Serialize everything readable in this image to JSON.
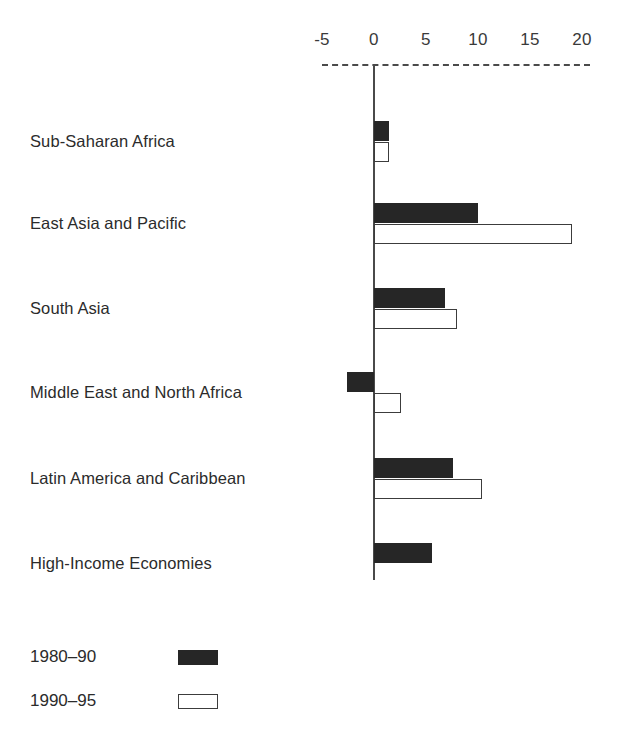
{
  "chart_data": {
    "type": "bar",
    "orientation": "horizontal",
    "title": "",
    "subtitle": "",
    "xlabel": "",
    "ylabel": "",
    "xlim": [
      -5,
      20
    ],
    "grid": false,
    "legend_position": "bottom-left",
    "xticks": [
      "-5",
      "0",
      "5",
      "10",
      "15",
      "20"
    ],
    "xtick_values": [
      -5,
      0,
      5,
      10,
      15,
      20
    ],
    "categories": [
      "Sub-Saharan Africa",
      "East Asia and Pacific",
      "South Asia",
      "Middle East and North Africa",
      "Latin America and Caribbean",
      "High-Income Economies"
    ],
    "series": [
      {
        "name": "1980-90",
        "style": "filled",
        "color": "#262626",
        "values": [
          1.4,
          10.0,
          6.8,
          -2.6,
          7.6,
          5.6
        ]
      },
      {
        "name": "1990-95",
        "style": "open",
        "color": "#ffffff",
        "values": [
          1.4,
          19.0,
          8.0,
          2.6,
          10.4,
          null
        ]
      }
    ],
    "annotations": []
  },
  "legend": {
    "items": [
      {
        "label": "1980–90",
        "swatch": "filled"
      },
      {
        "label": "1990–95",
        "swatch": "open"
      }
    ]
  },
  "colors": {
    "axis": "#4a4a4a",
    "filled_bar": "#262626",
    "open_bar_border": "#3c3c3c",
    "text": "#2b2b2b",
    "background": "#ffffff"
  }
}
